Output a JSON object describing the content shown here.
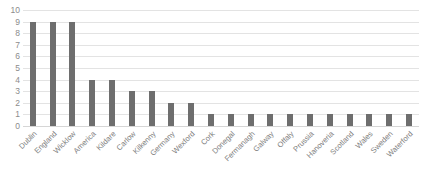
{
  "chart_data": {
    "type": "bar",
    "title": "",
    "subtitle": "",
    "xlabel": "",
    "ylabel": "",
    "ylim": [
      0,
      10
    ],
    "ytick_step": 1,
    "yticks": [
      "10",
      "9",
      "8",
      "7",
      "6",
      "5",
      "4",
      "3",
      "2",
      "1",
      "0"
    ],
    "grid": true,
    "grid_axis": "y",
    "legend": false,
    "legend_position": "none",
    "bar_color": "#6e6e6e",
    "gridline_color": "#e3e3e3",
    "axis_text_color": "#8c8c8c",
    "background_color": "#ffffff",
    "categories": [
      "Dublin",
      "England",
      "Wicklow",
      "America",
      "Kildare",
      "Carlow",
      "Kilkenny",
      "Germany",
      "Wexford",
      "Cork",
      "Donegal",
      "Fermanagh",
      "Galway",
      "Offaly",
      "Prussia",
      "Hanoveria",
      "Scotland",
      "Wales",
      "Sweden",
      "Waterford"
    ],
    "values": [
      9,
      9,
      9,
      4,
      4,
      3,
      3,
      2,
      2,
      1,
      1,
      1,
      1,
      1,
      1,
      1,
      1,
      1,
      1,
      1
    ]
  }
}
